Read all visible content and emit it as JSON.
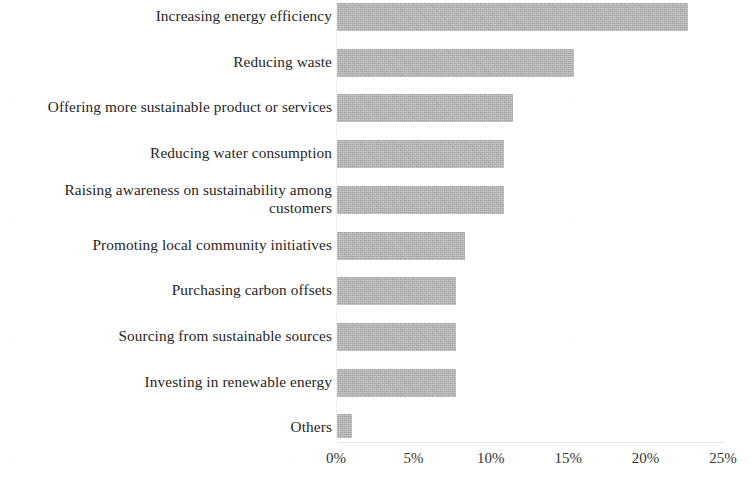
{
  "chart_data": {
    "type": "bar",
    "orientation": "horizontal",
    "title": "",
    "subtitle": "",
    "xlabel": "",
    "ylabel": "",
    "xlim": [
      0,
      25
    ],
    "xticks": [
      "0%",
      "5%",
      "10%",
      "15%",
      "20%",
      "25%"
    ],
    "xtick_values": [
      0,
      5,
      10,
      15,
      20,
      25
    ],
    "grid": false,
    "legend": null,
    "value_suffix": "%",
    "bar_color": "#b5b5b5",
    "categories": [
      "Increasing energy efficiency",
      "Reducing waste",
      "Offering more sustainable product or services",
      "Reducing water consumption",
      "Raising awareness on sustainability among customers",
      "Promoting local community initiatives",
      "Purchasing carbon offsets",
      "Sourcing from sustainable sources",
      "Investing in renewable energy",
      "Others"
    ],
    "values": [
      22.7,
      15.3,
      11.4,
      10.8,
      10.8,
      8.3,
      7.7,
      7.7,
      7.7,
      1.0
    ]
  },
  "bars": [
    {
      "label": "Increasing energy efficiency",
      "value": 22.7,
      "lines": 1
    },
    {
      "label": "Reducing waste",
      "value": 15.3,
      "lines": 1
    },
    {
      "label": "Offering more sustainable product or services",
      "value": 11.4,
      "lines": 1
    },
    {
      "label": "Reducing water consumption",
      "value": 10.8,
      "lines": 1
    },
    {
      "label": "Raising awareness on sustainability among\ncustomers",
      "value": 10.8,
      "lines": 2
    },
    {
      "label": "Promoting local community initiatives",
      "value": 8.3,
      "lines": 1
    },
    {
      "label": "Purchasing carbon offsets",
      "value": 7.7,
      "lines": 1
    },
    {
      "label": "Sourcing from sustainable sources",
      "value": 7.7,
      "lines": 1
    },
    {
      "label": "Investing in renewable energy",
      "value": 7.7,
      "lines": 1
    },
    {
      "label": "Others",
      "value": 1.0,
      "lines": 1
    }
  ],
  "axis": {
    "ticks": [
      "0%",
      "5%",
      "10%",
      "15%",
      "20%",
      "25%"
    ]
  }
}
